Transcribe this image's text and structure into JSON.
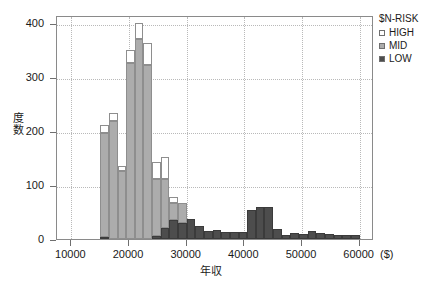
{
  "chart_data": {
    "type": "bar",
    "subtype": "stacked-histogram",
    "title": "",
    "xlabel": "年収",
    "xunit": "($)",
    "ylabel": "度数",
    "xlim": [
      7500,
      62500
    ],
    "ylim": [
      0,
      415
    ],
    "xticks": [
      10000,
      20000,
      30000,
      40000,
      50000,
      60000
    ],
    "xtick_labels": [
      "10000",
      "20000",
      "30000",
      "40000",
      "50000",
      "60000"
    ],
    "yticks": [
      0,
      100,
      200,
      300,
      400
    ],
    "ytick_labels": [
      "0",
      "100",
      "200",
      "300",
      "400"
    ],
    "grid": true,
    "legend": {
      "title": "$N-RISK",
      "position": "right-top",
      "entries": [
        {
          "name": "HIGH",
          "color": "#ffffff"
        },
        {
          "name": "MID",
          "color": "#acacac"
        },
        {
          "name": "LOW",
          "color": "#4d4d4d"
        }
      ]
    },
    "bin_width": 1500,
    "bin_starts": [
      15000,
      16500,
      18000,
      19500,
      21000,
      22500,
      24000,
      25500,
      27000,
      28500,
      30000,
      31500,
      33000,
      34500,
      36000,
      37500,
      39000,
      40500,
      42000,
      43500,
      45000,
      46500,
      48000,
      49500,
      51000,
      52500,
      54000,
      55500,
      57000,
      58500
    ],
    "bin_centers": [
      15750,
      17250,
      18750,
      20250,
      21750,
      23250,
      24750,
      26250,
      27750,
      29250,
      30750,
      32250,
      33750,
      35250,
      36750,
      38250,
      39750,
      41250,
      42750,
      44250,
      45750,
      47250,
      48750,
      50250,
      51750,
      53250,
      54750,
      56250,
      57750,
      59250
    ],
    "series": [
      {
        "name": "LOW",
        "color": "#4d4d4d",
        "values": [
          3,
          0,
          0,
          0,
          0,
          0,
          6,
          21,
          36,
          29,
          38,
          25,
          14,
          16,
          13,
          13,
          13,
          53,
          59,
          60,
          19,
          8,
          11,
          9,
          14,
          11,
          9,
          8,
          8,
          8
        ]
      },
      {
        "name": "MID",
        "color": "#acacac",
        "values": [
          194,
          218,
          126,
          327,
          371,
          322,
          105,
          91,
          31,
          38,
          0,
          0,
          0,
          0,
          0,
          0,
          0,
          0,
          0,
          0,
          0,
          0,
          0,
          0,
          0,
          0,
          0,
          0,
          0,
          0
        ]
      },
      {
        "name": "HIGH",
        "color": "#ffffff",
        "values": [
          14,
          15,
          9,
          23,
          29,
          42,
          31,
          40,
          11,
          0,
          0,
          0,
          0,
          0,
          0,
          0,
          0,
          0,
          0,
          0,
          0,
          0,
          0,
          0,
          0,
          0,
          0,
          0,
          0,
          0
        ]
      }
    ],
    "stack_totals": [
      211,
      233,
      135,
      350,
      400,
      364,
      142,
      152,
      78,
      67,
      38,
      25,
      14,
      16,
      13,
      13,
      13,
      53,
      59,
      60,
      19,
      8,
      11,
      9,
      14,
      11,
      9,
      8,
      8,
      8
    ]
  }
}
